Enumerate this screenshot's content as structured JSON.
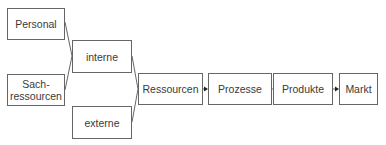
{
  "diagram": {
    "type": "flow",
    "nodes": [
      {
        "id": "personal",
        "label": "Personal"
      },
      {
        "id": "sach",
        "label": "Sach-\nressourcen"
      },
      {
        "id": "interne",
        "label": "interne"
      },
      {
        "id": "externe",
        "label": "externe"
      },
      {
        "id": "ressourcen",
        "label": "Ressourcen"
      },
      {
        "id": "prozesse",
        "label": "Prozesse"
      },
      {
        "id": "produkte",
        "label": "Produkte"
      },
      {
        "id": "markt",
        "label": "Markt"
      }
    ],
    "edges": [
      {
        "from": "personal",
        "to": "interne"
      },
      {
        "from": "sach",
        "to": "interne"
      },
      {
        "from": "interne",
        "to": "ressourcen"
      },
      {
        "from": "externe",
        "to": "ressourcen"
      },
      {
        "from": "ressourcen",
        "to": "prozesse"
      },
      {
        "from": "prozesse",
        "to": "produkte"
      },
      {
        "from": "produkte",
        "to": "markt"
      }
    ],
    "colors": {
      "border": "#666666",
      "text": "#3a3a3a",
      "background": "#ffffff"
    }
  }
}
